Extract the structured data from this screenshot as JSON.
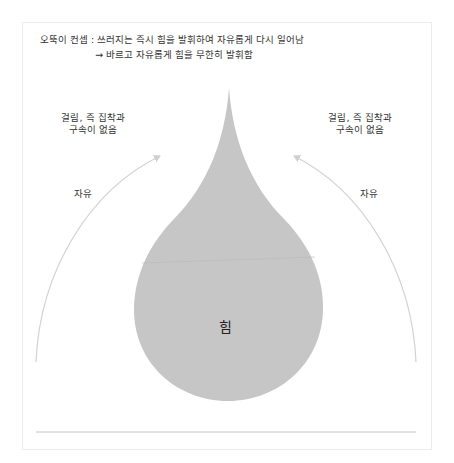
{
  "title": {
    "line1": "오뚝이 컨셉 : 쓰러지는 즉시 힘을 발휘하여 자유롭게 다시 일어남",
    "line2": "→ 바르고 자유롭게 힘을 무한히 발휘함"
  },
  "left": {
    "note_line1": "걸림, 즉 집착과",
    "note_line2": "구속이 없음",
    "arrow_label": "자유"
  },
  "right": {
    "note_line1": "걸림, 즉 집착과",
    "note_line2": "구속이 없음",
    "arrow_label": "자유"
  },
  "drop": {
    "label": "힘",
    "fill": "#c6c6c6"
  },
  "colors": {
    "arrow": "#cfcfcf",
    "baseline": "#bdbdbd",
    "frame": "#ececec"
  }
}
